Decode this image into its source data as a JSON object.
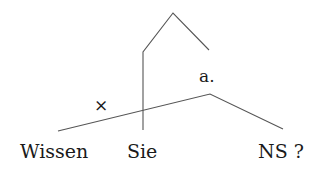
{
  "diagram": {
    "type": "syntactic-tree",
    "nodes": {
      "upper_label": "a.",
      "cross_mark": "×",
      "leaves": [
        "Wissen",
        "Sie",
        "NS ?"
      ]
    },
    "colors": {
      "line": "#555555",
      "text": "#1a1a1a"
    }
  }
}
